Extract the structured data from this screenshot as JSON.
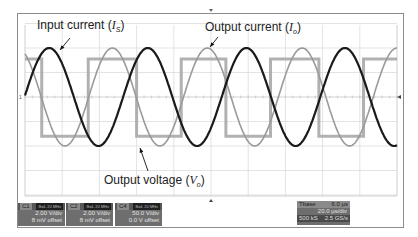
{
  "chart_data": {
    "type": "line",
    "title": "",
    "xlabel": "",
    "ylabel": "",
    "grid": true,
    "x_divisions": 10,
    "y_divisions": 8,
    "x_range_div": [
      0,
      10
    ],
    "y_range_div": [
      -4,
      4
    ],
    "series": [
      {
        "name": "Input current (I_S)",
        "shape": "sine",
        "color": "#1a1a1a",
        "amplitude_div": 2.0,
        "period_div": 2.65,
        "phase_peak_div": 0.65
      },
      {
        "name": "Output current (I_o)",
        "shape": "sine",
        "color": "#9a9a9a",
        "amplitude_div": 2.0,
        "period_div": 2.55,
        "phase_peak_div": 2.35
      },
      {
        "name": "Output voltage (V_o)",
        "shape": "square",
        "color": "#a8a8a8",
        "high_div": 1.55,
        "low_div": -1.6,
        "transitions_div": [
          0.45,
          1.7,
          3.0,
          4.2,
          5.4,
          6.6,
          7.9,
          9.1
        ]
      }
    ],
    "annotations": [
      {
        "text": "Input current",
        "symbol": "I",
        "subscript": "S"
      },
      {
        "text": "Output current",
        "symbol": "I",
        "subscript": "o"
      },
      {
        "text": "Output voltage",
        "symbol": "V",
        "subscript": "o"
      }
    ],
    "zero_marker": "1"
  },
  "readouts": {
    "channels": [
      {
        "id": "C1",
        "bw": "BwL 20 MHz",
        "scale": "2.00 V/div",
        "offset": "8 mV offset"
      },
      {
        "id": "C2",
        "bw": "BwL 20 MHz",
        "scale": "2.00 V/div",
        "offset": "8 mV offset"
      },
      {
        "id": "C4",
        "bw": "BwL 20 MHz",
        "scale": "50.0 V/div",
        "offset": "0.0 V offset"
      }
    ],
    "timebase": {
      "label": "Tbase",
      "value": "6.0 µs",
      "row2": "20.0 µs/div",
      "sample_rate_label": "500 kS",
      "sample_rate": "2.5 GS/s"
    }
  }
}
